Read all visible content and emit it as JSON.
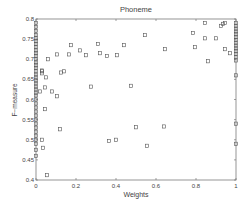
{
  "chart_data": {
    "type": "scatter",
    "title": "Phoneme",
    "xlabel": "Weights",
    "ylabel": "F−measure",
    "xlim": [
      0,
      1
    ],
    "ylim": [
      0.4,
      0.8
    ],
    "xticks": [
      0,
      0.2,
      0.4,
      0.6,
      0.8,
      1
    ],
    "xtick_labels": [
      "0",
      "0.2",
      "0.4",
      "0.6",
      "0.8",
      "1"
    ],
    "yticks": [
      0.4,
      0.45,
      0.5,
      0.55,
      0.6,
      0.65,
      0.7,
      0.75,
      0.8
    ],
    "ytick_labels": [
      "0.4",
      "0.45",
      "0.5",
      "0.55",
      "0.6",
      "0.65",
      "0.7",
      "0.75",
      "0.8"
    ],
    "grid": false,
    "legend": null,
    "marker": "square",
    "marker_color": "#555555",
    "series": [
      {
        "name": "points",
        "x": [
          0.175,
          0.31,
          0.44,
          0.105,
          0.165,
          0.22,
          0.25,
          0.32,
          0.355,
          0.405,
          0.06,
          0.03,
          0.03,
          0.05,
          0.03,
          0.125,
          0.14,
          0.045,
          0.02,
          0.08,
          0.105,
          0.275,
          0.475,
          0.045,
          0.12,
          0.5,
          0.64,
          0.03,
          0.035,
          0.365,
          0.4,
          0.555,
          0.055,
          0.545,
          0.845,
          0.925,
          0.935,
          0.945,
          0.785,
          0.845,
          0.9,
          0.645,
          0.795,
          0.945,
          0.97,
          0.86
        ],
        "y": [
          0.735,
          0.738,
          0.735,
          0.712,
          0.712,
          0.722,
          0.71,
          0.715,
          0.708,
          0.71,
          0.7,
          0.672,
          0.67,
          0.655,
          0.665,
          0.667,
          0.67,
          0.63,
          0.62,
          0.62,
          0.608,
          0.632,
          0.634,
          0.576,
          0.526,
          0.531,
          0.533,
          0.5,
          0.48,
          0.497,
          0.5,
          0.485,
          0.412,
          0.76,
          0.79,
          0.783,
          0.788,
          0.79,
          0.765,
          0.752,
          0.752,
          0.725,
          0.73,
          0.725,
          0.715,
          0.695
        ]
      },
      {
        "name": "weight-0-column",
        "x": [
          0,
          0,
          0,
          0,
          0,
          0,
          0,
          0,
          0,
          0,
          0,
          0,
          0,
          0,
          0,
          0,
          0,
          0,
          0,
          0,
          0,
          0,
          0,
          0,
          0,
          0,
          0,
          0,
          0,
          0,
          0,
          0,
          0,
          0,
          0,
          0,
          0,
          0
        ],
        "y": [
          0.79,
          0.78,
          0.77,
          0.76,
          0.752,
          0.745,
          0.738,
          0.73,
          0.722,
          0.715,
          0.708,
          0.7,
          0.692,
          0.685,
          0.678,
          0.67,
          0.662,
          0.655,
          0.647,
          0.64,
          0.632,
          0.625,
          0.617,
          0.61,
          0.6,
          0.59,
          0.58,
          0.57,
          0.56,
          0.55,
          0.54,
          0.53,
          0.52,
          0.51,
          0.5,
          0.49,
          0.475,
          0.46
        ]
      },
      {
        "name": "weight-1-column",
        "x": [
          1,
          1,
          1,
          1,
          1,
          1,
          1,
          1,
          1,
          1,
          1,
          1,
          1,
          1,
          1,
          1,
          1
        ],
        "y": [
          0.79,
          0.783,
          0.776,
          0.769,
          0.762,
          0.755,
          0.748,
          0.741,
          0.734,
          0.727,
          0.72,
          0.713,
          0.705,
          0.697,
          0.66,
          0.54,
          0.49
        ]
      }
    ]
  }
}
